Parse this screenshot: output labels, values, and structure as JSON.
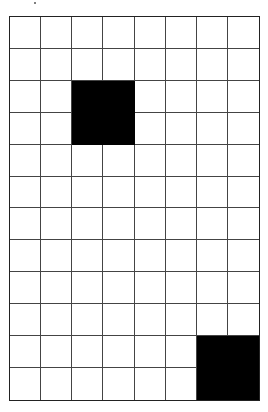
{
  "grid": {
    "columns": 8,
    "rows": 12,
    "line_color": "#444444",
    "fill_color": "#000000",
    "empty_color": "#ffffff",
    "filled_regions": [
      {
        "name": "upper-black-square",
        "col_start": 2,
        "col_end": 3,
        "row_start": 2,
        "row_end": 3
      },
      {
        "name": "lower-black-square",
        "col_start": 6,
        "col_end": 7,
        "row_start": 10,
        "row_end": 11
      }
    ]
  }
}
